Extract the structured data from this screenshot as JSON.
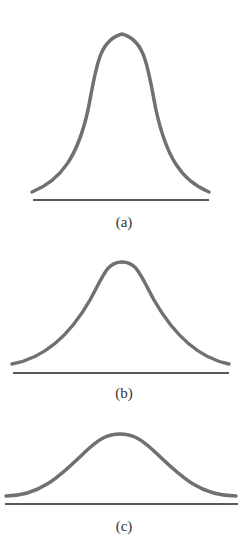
{
  "figure": {
    "panels": [
      {
        "label": "(a)",
        "description": "tall narrow bell curve"
      },
      {
        "label": "(b)",
        "description": "medium bell curve"
      },
      {
        "label": "(c)",
        "description": "flat wide bell curve"
      }
    ],
    "colors": {
      "curve": "#707070",
      "baseline": "#222222",
      "label": "#333333"
    }
  }
}
